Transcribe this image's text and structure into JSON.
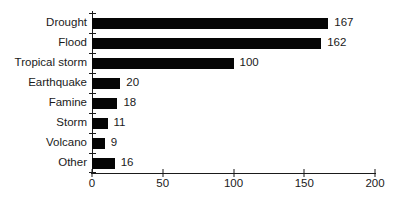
{
  "chart_data": {
    "type": "bar",
    "orientation": "horizontal",
    "title": "",
    "xlabel": "",
    "ylabel": "",
    "categories": [
      "Drought",
      "Flood",
      "Tropical storm",
      "Earthquake",
      "Famine",
      "Storm",
      "Volcano",
      "Other"
    ],
    "values": [
      167,
      162,
      100,
      20,
      18,
      11,
      9,
      16
    ],
    "value_labels": [
      "167",
      "162",
      "100",
      "20",
      "18",
      "11",
      "9",
      "16"
    ],
    "xlim": [
      0,
      200
    ],
    "xticks": [
      0,
      50,
      100,
      150,
      200
    ],
    "grid": false,
    "legend": null,
    "bar_color": "#050505",
    "axis_color": "#1a1a1a",
    "background_color": "#ffffff"
  }
}
